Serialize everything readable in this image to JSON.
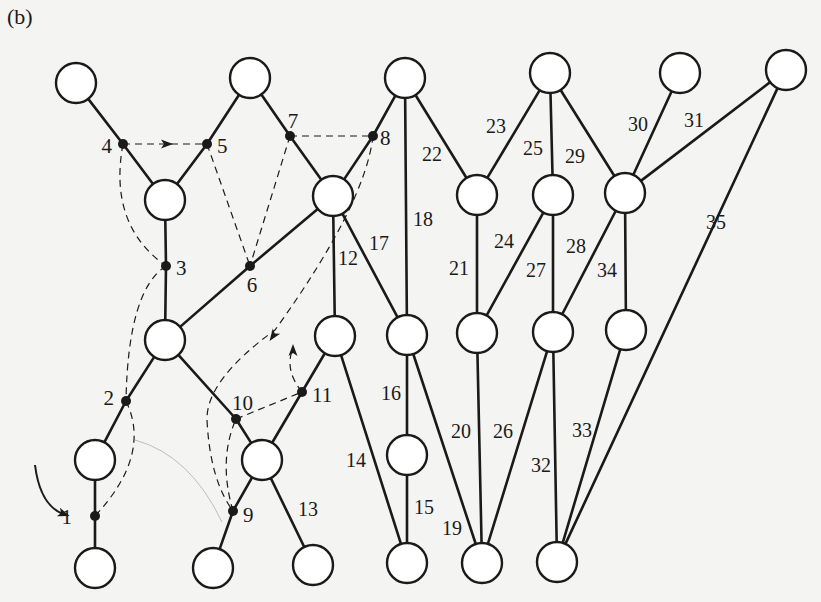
{
  "figure": {
    "panel_label": "(b)",
    "colors": {
      "background": "#f4f4f2",
      "ink": "#1a1a1a",
      "faint": "#bdbdbd"
    },
    "node_radius": 20,
    "nodes": [
      {
        "id": "A",
        "x": 76,
        "y": 83
      },
      {
        "id": "B",
        "x": 250,
        "y": 78
      },
      {
        "id": "C",
        "x": 405,
        "y": 78
      },
      {
        "id": "D",
        "x": 550,
        "y": 73
      },
      {
        "id": "E",
        "x": 680,
        "y": 73
      },
      {
        "id": "F",
        "x": 786,
        "y": 70
      },
      {
        "id": "G",
        "x": 165,
        "y": 200
      },
      {
        "id": "H",
        "x": 333,
        "y": 196
      },
      {
        "id": "I",
        "x": 477,
        "y": 195
      },
      {
        "id": "J",
        "x": 553,
        "y": 195
      },
      {
        "id": "K",
        "x": 625,
        "y": 193
      },
      {
        "id": "L",
        "x": 165,
        "y": 340
      },
      {
        "id": "M",
        "x": 335,
        "y": 336
      },
      {
        "id": "N",
        "x": 407,
        "y": 335
      },
      {
        "id": "O",
        "x": 477,
        "y": 333
      },
      {
        "id": "P",
        "x": 553,
        "y": 332
      },
      {
        "id": "Q",
        "x": 626,
        "y": 330
      },
      {
        "id": "R",
        "x": 95,
        "y": 460
      },
      {
        "id": "S",
        "x": 262,
        "y": 460
      },
      {
        "id": "T",
        "x": 407,
        "y": 455
      },
      {
        "id": "U",
        "x": 95,
        "y": 568
      },
      {
        "id": "V",
        "x": 213,
        "y": 568
      },
      {
        "id": "W",
        "x": 313,
        "y": 565
      },
      {
        "id": "X",
        "x": 407,
        "y": 563
      },
      {
        "id": "Y",
        "x": 482,
        "y": 563
      },
      {
        "id": "Z",
        "x": 557,
        "y": 562
      }
    ],
    "junctions": [
      {
        "label": "1",
        "x": 95,
        "y": 516,
        "lx": 72,
        "ly": 524,
        "anchor": "end"
      },
      {
        "label": "2",
        "x": 126,
        "y": 401,
        "lx": 114,
        "ly": 405,
        "anchor": "end"
      },
      {
        "label": "3",
        "x": 166,
        "y": 266,
        "lx": 176,
        "ly": 275,
        "anchor": "start"
      },
      {
        "label": "4",
        "x": 123,
        "y": 144,
        "lx": 112,
        "ly": 153,
        "anchor": "end"
      },
      {
        "label": "5",
        "x": 207,
        "y": 144,
        "lx": 217,
        "ly": 153,
        "anchor": "start"
      },
      {
        "label": "6",
        "x": 250,
        "y": 266,
        "lx": 252,
        "ly": 292,
        "anchor": "middle"
      },
      {
        "label": "7",
        "x": 290,
        "y": 136,
        "lx": 293,
        "ly": 128,
        "anchor": "middle"
      },
      {
        "label": "8",
        "x": 373,
        "y": 136,
        "lx": 380,
        "ly": 145,
        "anchor": "start"
      },
      {
        "label": "9",
        "x": 233,
        "y": 511,
        "lx": 243,
        "ly": 522,
        "anchor": "start"
      },
      {
        "label": "10",
        "x": 236,
        "y": 419,
        "lx": 232,
        "ly": 410,
        "anchor": "start"
      },
      {
        "label": "11",
        "x": 302,
        "y": 392,
        "lx": 312,
        "ly": 402,
        "anchor": "start"
      }
    ],
    "solid_edges": [
      {
        "from": "A",
        "to": "4"
      },
      {
        "from": "4",
        "to": "G"
      },
      {
        "from": "G",
        "to": "5"
      },
      {
        "from": "5",
        "to": "B"
      },
      {
        "from": "B",
        "to": "7"
      },
      {
        "from": "7",
        "to": "H"
      },
      {
        "from": "H",
        "to": "8"
      },
      {
        "from": "8",
        "to": "C"
      },
      {
        "from": "G",
        "to": "3"
      },
      {
        "from": "3",
        "to": "L"
      },
      {
        "from": "L",
        "to": "6"
      },
      {
        "from": "6",
        "to": "H"
      },
      {
        "from": "L",
        "to": "2"
      },
      {
        "from": "2",
        "to": "R"
      },
      {
        "from": "R",
        "to": "1"
      },
      {
        "from": "1",
        "to": "U"
      },
      {
        "from": "L",
        "to": "10"
      },
      {
        "from": "10",
        "to": "S"
      },
      {
        "from": "S",
        "to": "11"
      },
      {
        "from": "11",
        "to": "M"
      },
      {
        "from": "S",
        "to": "9"
      },
      {
        "from": "9",
        "to": "V"
      }
    ],
    "labeled_edges": [
      {
        "label": "12",
        "from": "H",
        "to": "M",
        "lx": 338,
        "ly": 265
      },
      {
        "label": "13",
        "from": "S",
        "to": "W",
        "lx": 298,
        "ly": 516
      },
      {
        "label": "14",
        "from": "M",
        "to": "X",
        "lx": 346,
        "ly": 467
      },
      {
        "label": "15",
        "from": "T",
        "to": "X",
        "lx": 414,
        "ly": 514
      },
      {
        "label": "16",
        "from": "N",
        "to": "T",
        "lx": 381,
        "ly": 400
      },
      {
        "label": "17",
        "from": "H",
        "to": "N",
        "lx": 369,
        "ly": 250
      },
      {
        "label": "18",
        "from": "C",
        "to": "N",
        "lx": 413,
        "ly": 226
      },
      {
        "label": "19",
        "from": "N",
        "to": "Y",
        "lx": 442,
        "ly": 535
      },
      {
        "label": "20",
        "from": "O",
        "to": "Y",
        "lx": 451,
        "ly": 438
      },
      {
        "label": "21",
        "from": "I",
        "to": "O",
        "lx": 449,
        "ly": 275
      },
      {
        "label": "22",
        "from": "C",
        "to": "I",
        "lx": 422,
        "ly": 161
      },
      {
        "label": "23",
        "from": "D",
        "to": "I",
        "lx": 486,
        "ly": 133
      },
      {
        "label": "24",
        "from": "J",
        "to": "O",
        "lx": 494,
        "ly": 248
      },
      {
        "label": "25",
        "from": "D",
        "to": "J",
        "lx": 523,
        "ly": 155
      },
      {
        "label": "26",
        "from": "P",
        "to": "Y",
        "lx": 493,
        "ly": 438
      },
      {
        "label": "27",
        "from": "J",
        "to": "P",
        "lx": 526,
        "ly": 277
      },
      {
        "label": "28",
        "from": "K",
        "to": "P",
        "lx": 566,
        "ly": 253
      },
      {
        "label": "29",
        "from": "D",
        "to": "K",
        "lx": 565,
        "ly": 163
      },
      {
        "label": "30",
        "from": "E",
        "to": "K",
        "lx": 628,
        "ly": 131
      },
      {
        "label": "31",
        "from": "F",
        "to": "K",
        "lx": 684,
        "ly": 127
      },
      {
        "label": "32",
        "from": "P",
        "to": "Z",
        "lx": 531,
        "ly": 472
      },
      {
        "label": "33",
        "from": "Q",
        "to": "Z",
        "lx": 572,
        "ly": 437
      },
      {
        "label": "34",
        "from": "K",
        "to": "Q",
        "lx": 597,
        "ly": 277
      },
      {
        "label": "35",
        "from": "F",
        "to": "Z",
        "lx": 706,
        "ly": 229
      }
    ],
    "dashed_paths": [
      {
        "name": "dash-4-to-5",
        "d": "M123,144 L207,144",
        "arrow": {
          "x": 167,
          "y": 144,
          "angle": 0
        }
      },
      {
        "name": "dash-7-to-8",
        "d": "M290,136 L373,136"
      },
      {
        "name": "dash-5-to-6",
        "d": "M207,144 L250,266"
      },
      {
        "name": "dash-7-to-6",
        "d": "M290,136 L250,266"
      },
      {
        "name": "dash-4-to-3",
        "d": "M123,144 Q108,225 166,266"
      },
      {
        "name": "dash-3-to-2",
        "d": "M166,266 Q128,290 126,401"
      },
      {
        "name": "dash-2-to-1",
        "d": "M126,401 Q152,455 95,516"
      },
      {
        "name": "dash-8-to-9",
        "d": "M373,136 Q365,205 275,330 Q206,380 207,420 Q210,480 233,511",
        "arrow": {
          "x": 273,
          "y": 336,
          "angle": 125
        }
      },
      {
        "name": "dash-9-to-10",
        "d": "M233,511 Q218,460 236,419"
      },
      {
        "name": "dash-10-to-11",
        "d": "M236,419 L302,392"
      },
      {
        "name": "dash-11-up",
        "d": "M302,392 Q284,370 293,348",
        "arrow": {
          "x": 293,
          "y": 350,
          "angle": -90
        }
      }
    ],
    "faint_path": {
      "d": "M135,440 Q190,455 222,522"
    },
    "start_arrow": {
      "d": "M35,465 Q40,505 63,514",
      "head": {
        "x": 64,
        "y": 514,
        "angle": 20
      }
    }
  }
}
